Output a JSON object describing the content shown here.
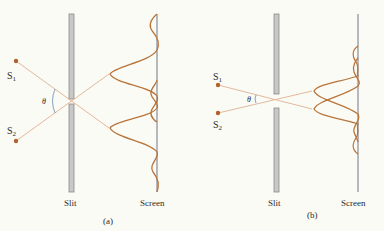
{
  "figure": {
    "panels": [
      {
        "id": "a",
        "caption": "(a)",
        "source1_label": "S",
        "source1_sub": "1",
        "source2_label": "S",
        "source2_sub": "2",
        "angle_label": "θ",
        "slit_label": "Slit",
        "screen_label": "Screen"
      },
      {
        "id": "b",
        "caption": "(b)",
        "source1_label": "S",
        "source1_sub": "1",
        "source2_label": "S",
        "source2_sub": "2",
        "angle_label": "θ",
        "slit_label": "Slit",
        "screen_label": "Screen"
      }
    ],
    "colors": {
      "ray": "#e0b090",
      "curve": "#b8753a",
      "source": "#b5602a",
      "slit_fill": "#c8c8c8",
      "slit_edge": "#8a8a8a",
      "screen": "#8a8a9a",
      "angle_arc": "#6a8ab0"
    }
  }
}
